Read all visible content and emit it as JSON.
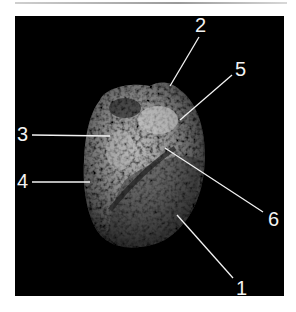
{
  "figure": {
    "background_color": "#000000",
    "label_color": "#f2f2f2",
    "labels": [
      {
        "id": "1",
        "text": "1"
      },
      {
        "id": "2",
        "text": "2"
      },
      {
        "id": "3",
        "text": "3"
      },
      {
        "id": "4",
        "text": "4"
      },
      {
        "id": "5",
        "text": "5"
      },
      {
        "id": "6",
        "text": "6"
      }
    ]
  }
}
